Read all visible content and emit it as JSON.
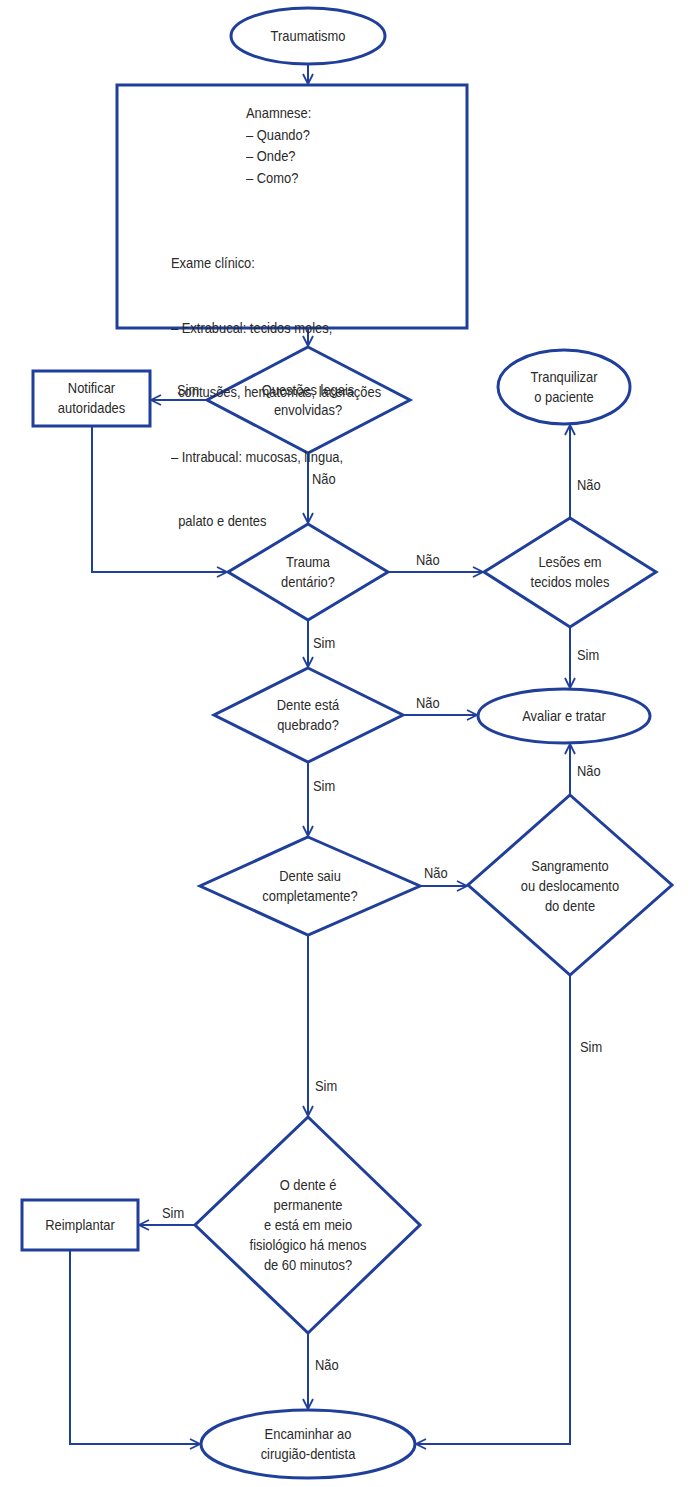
{
  "colors": {
    "stroke": "#1f3f9a",
    "text": "#2a2a2a",
    "background": "#ffffff"
  },
  "nodes": {
    "start": {
      "shape": "ellipse",
      "label": "Traumatismo"
    },
    "exam": {
      "shape": "rectangle",
      "anamnese_title": "Anamnese:",
      "anamnese_items": [
        "– Quando?",
        "– Onde?",
        "– Como?"
      ],
      "exame_title": "Exame clínico:",
      "exame_items": [
        "– Extrabucal: tecidos moles,",
        "  contusões, hematomas, lacerações",
        "– Intrabucal: mucosas, língua,",
        "  palato e dentes"
      ]
    },
    "legal": {
      "shape": "diamond",
      "lines": [
        "Questões legais",
        "envolvidas?"
      ]
    },
    "notify": {
      "shape": "rectangle",
      "lines": [
        "Notificar",
        "autoridades"
      ]
    },
    "calm": {
      "shape": "ellipse",
      "lines": [
        "Tranquilizar",
        "o paciente"
      ]
    },
    "dental": {
      "shape": "diamond",
      "lines": [
        "Trauma",
        "dentário?"
      ]
    },
    "soft": {
      "shape": "diamond",
      "lines": [
        "Lesões em",
        "tecidos moles"
      ]
    },
    "broken": {
      "shape": "diamond",
      "lines": [
        "Dente está",
        "quebrado?"
      ]
    },
    "evaluate": {
      "shape": "ellipse",
      "label": "Avaliar e tratar"
    },
    "avulsed": {
      "shape": "diamond",
      "lines": [
        "Dente saiu",
        "completamente?"
      ]
    },
    "bleeding": {
      "shape": "diamond",
      "lines": [
        "Sangramento",
        "ou deslocamento",
        "do dente"
      ]
    },
    "permanent": {
      "shape": "diamond",
      "lines": [
        "O dente é",
        "permanente",
        "e está em meio",
        "fisiológico há menos",
        "de 60 minutos?"
      ]
    },
    "replant": {
      "shape": "rectangle",
      "label": "Reimplantar"
    },
    "refer": {
      "shape": "ellipse",
      "lines": [
        "Encaminhar ao",
        "cirugião-dentista"
      ]
    }
  },
  "edges": [
    {
      "from": "start",
      "to": "exam",
      "label": ""
    },
    {
      "from": "exam",
      "to": "legal",
      "label": ""
    },
    {
      "from": "legal",
      "to": "notify",
      "label": "Sim"
    },
    {
      "from": "legal",
      "to": "dental",
      "label": "Não"
    },
    {
      "from": "notify",
      "to": "dental",
      "label": ""
    },
    {
      "from": "dental",
      "to": "soft",
      "label": "Não"
    },
    {
      "from": "soft",
      "to": "calm",
      "label": "Não"
    },
    {
      "from": "soft",
      "to": "evaluate",
      "label": "Sim"
    },
    {
      "from": "dental",
      "to": "broken",
      "label": "Sim"
    },
    {
      "from": "broken",
      "to": "evaluate",
      "label": "Não"
    },
    {
      "from": "broken",
      "to": "avulsed",
      "label": "Sim"
    },
    {
      "from": "avulsed",
      "to": "bleeding",
      "label": "Não"
    },
    {
      "from": "bleeding",
      "to": "evaluate",
      "label": "Não"
    },
    {
      "from": "bleeding",
      "to": "refer",
      "label": "Sim"
    },
    {
      "from": "avulsed",
      "to": "permanent",
      "label": "Sim"
    },
    {
      "from": "permanent",
      "to": "replant",
      "label": "Sim"
    },
    {
      "from": "permanent",
      "to": "refer",
      "label": "Não"
    },
    {
      "from": "replant",
      "to": "refer",
      "label": ""
    }
  ],
  "edge_labels": {
    "legal_sim": "Sim",
    "legal_nao": "Não",
    "dental_nao": "Não",
    "soft_nao": "Não",
    "soft_sim": "Sim",
    "dental_sim": "Sim",
    "broken_nao": "Não",
    "broken_sim": "Sim",
    "avulsed_nao": "Não",
    "bleeding_nao": "Não",
    "bleeding_sim": "Sim",
    "avulsed_sim": "Sim",
    "permanent_sim": "Sim",
    "permanent_nao": "Não"
  }
}
